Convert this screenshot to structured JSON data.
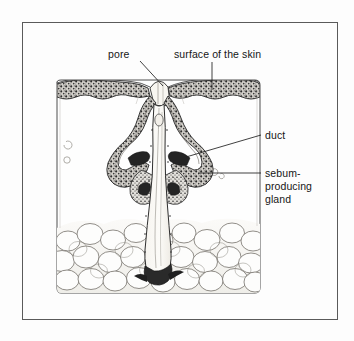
{
  "figure": {
    "type": "anatomical-line-diagram",
    "background_color": "#fdfdfd",
    "ink_color": "#1a1a1a",
    "frame": {
      "name": "outer-border",
      "x": 22,
      "y": 22,
      "width": 316,
      "height": 298,
      "stroke": "#555555",
      "stroke_width": 1
    }
  },
  "labels": [
    {
      "id": "pore",
      "text": "pore",
      "x": 108,
      "y": 58,
      "anchor": "start",
      "leader": {
        "type": "line",
        "x1": 140,
        "y1": 61,
        "x2": 163,
        "y2": 86
      }
    },
    {
      "id": "surface-of-the-skin",
      "text": "surface of the skin",
      "x": 174,
      "y": 58,
      "anchor": "start",
      "leader": {
        "type": "line",
        "x1": 212,
        "y1": 62,
        "x2": 212,
        "y2": 90
      }
    },
    {
      "id": "duct",
      "text": "duct",
      "x": 265,
      "y": 139,
      "anchor": "start",
      "leader": {
        "type": "line",
        "x1": 261,
        "y1": 135,
        "x2": 186,
        "y2": 157
      }
    },
    {
      "id": "sebum-producing-gland",
      "lines": [
        "sebum-",
        "producing",
        "gland"
      ],
      "x": 265,
      "y": 177,
      "line_height": 13,
      "anchor": "start",
      "leader": {
        "type": "line",
        "x1": 261,
        "y1": 173,
        "x2": 198,
        "y2": 173
      }
    }
  ],
  "structures": [
    {
      "name": "epidermis",
      "description": "stippled dark band forming the skin surface"
    },
    {
      "name": "dermis",
      "description": "pale open region beneath the epidermis"
    },
    {
      "name": "pore-opening",
      "description": "funnel opening at the skin surface"
    },
    {
      "name": "duct",
      "description": "central channel running from the pore down to the follicle"
    },
    {
      "name": "sebaceous-gland",
      "description": "lobed sebum-producing gland flanking the duct"
    },
    {
      "name": "hair-follicle-root",
      "description": "bulb at the base of the duct in the fat layer"
    },
    {
      "name": "subcutaneous-fat",
      "description": "cluster of rounded fat cells at the bottom"
    }
  ]
}
